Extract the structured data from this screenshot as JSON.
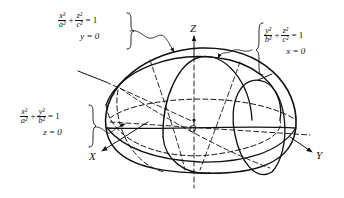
{
  "figure": {
    "axes": {
      "z_label": "Z",
      "y_label": "Y",
      "x_label": "X",
      "origin_label": "O"
    },
    "equations": {
      "xz": {
        "term1_num": "x²",
        "term1_den": "a²",
        "plus": "+",
        "term2_num": "z²",
        "term2_den": "c²",
        "equals": "= 1",
        "constraint": "y = 0"
      },
      "yz": {
        "term1_num": "y²",
        "term1_den": "b²",
        "plus": "+",
        "term2_num": "z²",
        "term2_den": "c²",
        "equals": "= 1",
        "constraint": "x = 0"
      },
      "xy": {
        "term1_num": "x²",
        "term1_den": "a²",
        "plus": "+",
        "term2_num": "y²",
        "term2_den": "b²",
        "equals": "= 1",
        "constraint": "z = 0"
      }
    },
    "colors": {
      "stroke": "#111111",
      "background": "#ffffff"
    }
  }
}
